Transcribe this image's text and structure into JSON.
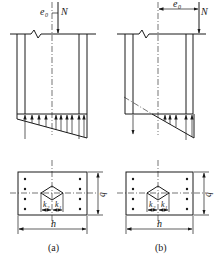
{
  "figure": {
    "panels": [
      {
        "id": "a",
        "caption": "(a)",
        "elevation": {
          "load_label": "N",
          "eccentricity_label": "e",
          "eccentricity_sub": "0",
          "pressure_distribution": "trapezoidal (full compression)"
        },
        "plan": {
          "width_label": "b",
          "length_label": "h",
          "k_left_label": "k",
          "k_left_sub": "2",
          "k_right_label": "k",
          "k_right_sub": "1"
        }
      },
      {
        "id": "b",
        "caption": "(b)",
        "elevation": {
          "load_label": "N",
          "eccentricity_label": "e",
          "eccentricity_sub": "0",
          "pressure_distribution": "triangular with partial tension"
        },
        "plan": {
          "width_label": "b",
          "length_label": "h",
          "k_left_label": "k",
          "k_left_sub": "2",
          "k_right_label": "k",
          "k_right_sub": "1"
        }
      }
    ],
    "colors": {
      "line": "#1a1a1a",
      "background": "#ffffff"
    }
  }
}
